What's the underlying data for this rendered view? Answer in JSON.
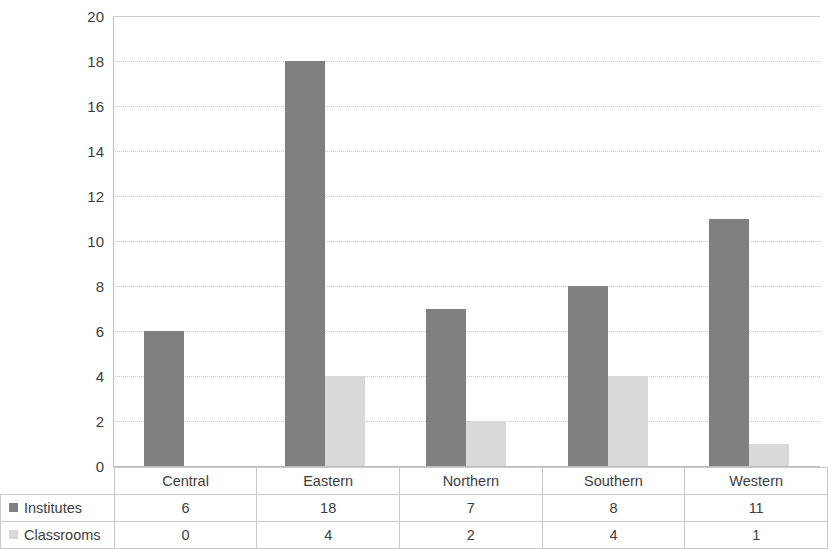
{
  "chart_data": {
    "type": "bar",
    "title": "",
    "subtitle": "",
    "xlabel": "",
    "ylabel": "",
    "categories": [
      "Central",
      "Eastern",
      "Northern",
      "Southern",
      "Western"
    ],
    "series": [
      {
        "name": "Institutes",
        "values": [
          6,
          18,
          7,
          8,
          11
        ],
        "color": "#808080"
      },
      {
        "name": "Classrooms",
        "values": [
          0,
          4,
          2,
          4,
          1
        ],
        "color": "#d9d9d9"
      }
    ],
    "ylim": [
      0,
      20
    ],
    "ytick_step": 2,
    "yticks": [
      20,
      18,
      16,
      14,
      12,
      10,
      8,
      6,
      4,
      2,
      0
    ],
    "grid": true,
    "grid_color": "#c8c8c8",
    "legend_position": "data-table",
    "has_data_table": true,
    "background": "#ffffff"
  },
  "table": {
    "corner_label": "",
    "header_row": [
      "Central",
      "Eastern",
      "Northern",
      "Southern",
      "Western"
    ],
    "rows": [
      {
        "label": "Institutes",
        "swatch": "series-0",
        "values": [
          "6",
          "18",
          "7",
          "8",
          "11"
        ]
      },
      {
        "label": "Classrooms",
        "swatch": "series-1",
        "values": [
          "0",
          "4",
          "2",
          "4",
          "1"
        ]
      }
    ]
  }
}
